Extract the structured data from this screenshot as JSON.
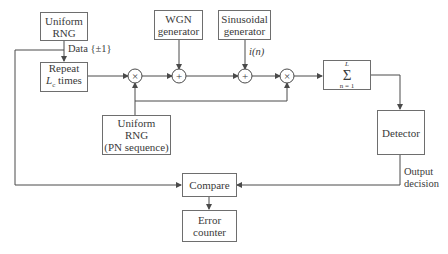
{
  "diagram": {
    "blocks": {
      "uniform_rng": {
        "line1": "Uniform",
        "line2": "RNG"
      },
      "repeat": {
        "line1": "Repeat",
        "line2_var": "L",
        "line2_sub": "c",
        "line2_rest": " times"
      },
      "wgn": {
        "line1": "WGN",
        "line2": "generator"
      },
      "sinusoidal": {
        "line1": "Sinusoidal",
        "line2": "generator"
      },
      "pn_rng": {
        "line1": "Uniform",
        "line2": "RNG",
        "line3": "(PN sequence)"
      },
      "summation": {
        "upper": "L",
        "symbol": "Σ",
        "lower": "n = 1"
      },
      "detector": {
        "label": "Detector"
      },
      "compare": {
        "label": "Compare"
      },
      "error_counter": {
        "line1": "Error",
        "line2": "counter"
      }
    },
    "operators": {
      "mult1": "×",
      "add1": "+",
      "add2": "+",
      "mult2": "×"
    },
    "labels": {
      "data": "Data {±1}",
      "interference": "i(n)",
      "output_line1": "Output",
      "output_line2": "decision"
    },
    "colors": {
      "line": "#4a4a4a",
      "box_border": "#6e6e6e",
      "text": "#3a3a3a"
    }
  }
}
